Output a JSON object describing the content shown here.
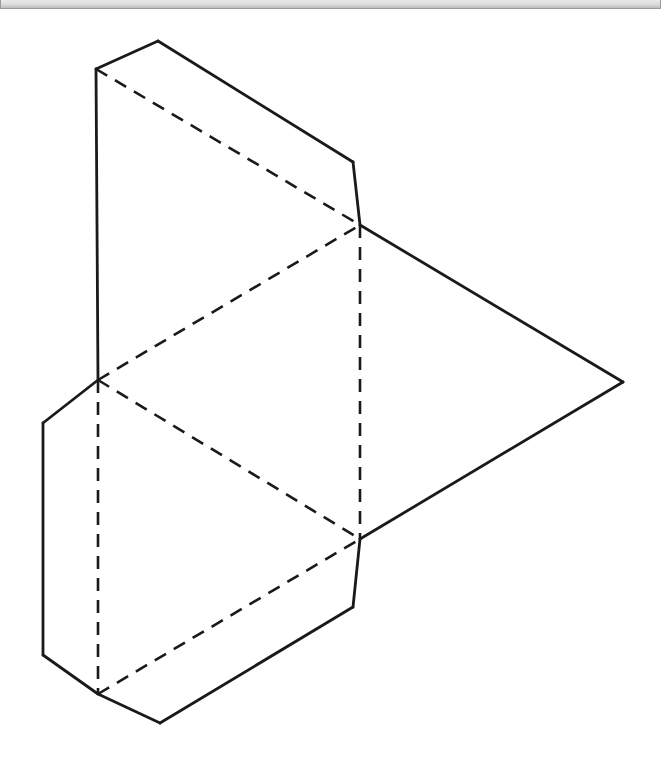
{
  "window": {
    "title": "",
    "top_bar": {
      "present": true,
      "style": "thin-gray-strip",
      "background_color": "#dcdcdc",
      "border_color": "#9a9a9a",
      "height_px": 9
    }
  },
  "figure": {
    "name": "triangular-prism-net",
    "canvas": {
      "width": 661,
      "height": 752
    },
    "stroke_color": "#1a1a1a",
    "background_color": "#ffffff",
    "stroke_width": 2.6,
    "dash_pattern": "13 9",
    "vertices": {
      "apex": [
        158,
        32
      ],
      "upper_left": [
        96,
        60
      ],
      "top_right_bend": [
        353,
        153
      ],
      "center_upper": [
        360,
        216
      ],
      "left_junction": [
        98,
        371
      ],
      "right_vertex": [
        623,
        373
      ],
      "flap_upper_left": [
        43,
        414
      ],
      "flap_lower_left": [
        43,
        646
      ],
      "center_lower": [
        360,
        530
      ],
      "lower_bend": [
        353,
        598
      ],
      "bottom_junction": [
        98,
        685
      ],
      "bottom_vertex": [
        160,
        714
      ]
    },
    "solid_paths": [
      {
        "name": "top-flap-left-ridge",
        "points": [
          [
            96,
            60
          ],
          [
            158,
            32
          ]
        ]
      },
      {
        "name": "top-flap-right-ridge",
        "points": [
          [
            158,
            32
          ],
          [
            353,
            153
          ]
        ]
      },
      {
        "name": "top-right-vertical-edge",
        "points": [
          [
            353,
            153
          ],
          [
            360,
            216
          ]
        ]
      },
      {
        "name": "left-vertical-upper-edge",
        "points": [
          [
            96,
            60
          ],
          [
            98,
            371
          ]
        ]
      },
      {
        "name": "left-flap-upper-bevel",
        "points": [
          [
            98,
            371
          ],
          [
            43,
            414
          ]
        ]
      },
      {
        "name": "left-flap-vertical-edge",
        "points": [
          [
            43,
            414
          ],
          [
            43,
            646
          ]
        ]
      },
      {
        "name": "left-flap-lower-bevel",
        "points": [
          [
            43,
            646
          ],
          [
            98,
            685
          ]
        ]
      },
      {
        "name": "bottom-flap-lower-ridge",
        "points": [
          [
            98,
            685
          ],
          [
            160,
            714
          ]
        ]
      },
      {
        "name": "bottom-flap-upper-ridge",
        "points": [
          [
            160,
            714
          ],
          [
            353,
            598
          ]
        ]
      },
      {
        "name": "bottom-right-vertical-edge",
        "points": [
          [
            353,
            598
          ],
          [
            360,
            530
          ]
        ]
      },
      {
        "name": "right-triangle-upper-edge",
        "points": [
          [
            360,
            216
          ],
          [
            623,
            373
          ]
        ]
      },
      {
        "name": "right-triangle-lower-edge",
        "points": [
          [
            623,
            373
          ],
          [
            360,
            530
          ]
        ]
      }
    ],
    "dashed_paths": [
      {
        "name": "hidden-fold-top-diagonal",
        "points": [
          [
            96,
            60
          ],
          [
            360,
            216
          ]
        ]
      },
      {
        "name": "hidden-fold-upper-diagonal",
        "points": [
          [
            98,
            371
          ],
          [
            360,
            216
          ]
        ]
      },
      {
        "name": "hidden-fold-lower-diagonal",
        "points": [
          [
            98,
            371
          ],
          [
            360,
            530
          ]
        ]
      },
      {
        "name": "hidden-fold-bottom-diagonal",
        "points": [
          [
            98,
            685
          ],
          [
            360,
            530
          ]
        ]
      },
      {
        "name": "hidden-fold-center-vertical",
        "points": [
          [
            360,
            216
          ],
          [
            360,
            530
          ]
        ]
      },
      {
        "name": "hidden-fold-left-vertical",
        "points": [
          [
            98,
            371
          ],
          [
            98,
            685
          ]
        ]
      }
    ]
  }
}
